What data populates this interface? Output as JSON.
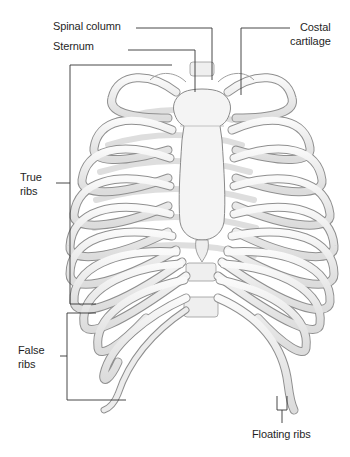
{
  "diagram": {
    "colors": {
      "background": "#ffffff",
      "bone_fill": "#f1f1f1",
      "bone_stroke": "#8a8a8a",
      "bone_shadow": "#c9c9c9",
      "leader_line": "#333333",
      "label_text": "#1f1f1f"
    },
    "labels": {
      "spinal_column": "Spinal column",
      "sternum": "Sternum",
      "costal_cartilage_line1": "Costal",
      "costal_cartilage_line2": "cartilage",
      "true_ribs_line1": "True",
      "true_ribs_line2": "ribs",
      "false_ribs_line1": "False",
      "false_ribs_line2": "ribs",
      "floating_ribs": "Floating ribs"
    }
  }
}
